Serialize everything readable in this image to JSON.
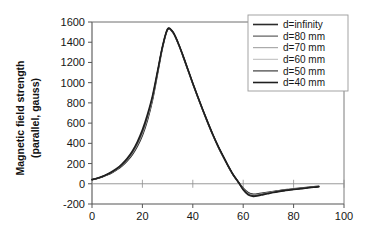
{
  "chart_data": {
    "type": "line",
    "title": "",
    "xlabel": "",
    "ylabel": "Magnetic field strength\n(parallel, gauss)",
    "ylabel_line1": "Magnetic field strength",
    "ylabel_line2": "(parallel, gauss)",
    "xlim": [
      0,
      100
    ],
    "ylim": [
      -200,
      1600
    ],
    "xticks": [
      0,
      20,
      40,
      60,
      80,
      100
    ],
    "xtick_labels": [
      "0",
      "20",
      "40",
      "60",
      "80",
      "100"
    ],
    "yticks": [
      -200,
      0,
      200,
      400,
      600,
      800,
      1000,
      1200,
      1400,
      1600
    ],
    "ytick_labels": [
      "-200",
      "0",
      "200",
      "400",
      "600",
      "800",
      "1000",
      "1200",
      "1400",
      "1600"
    ],
    "grid": false,
    "zero_line": true,
    "legend_position": "top-right",
    "legend_boxed": true,
    "legend": [
      "d=infinity",
      "d=80 mm",
      "d=70 mm",
      "d=60 mm",
      "d=50 mm",
      "d=40 mm"
    ],
    "x": [
      0,
      2,
      4,
      6,
      8,
      10,
      12,
      14,
      16,
      18,
      20,
      22,
      24,
      26,
      28,
      30,
      32,
      34,
      36,
      38,
      40,
      42,
      44,
      46,
      48,
      50,
      52,
      54,
      56,
      58,
      60,
      62,
      64,
      66,
      68,
      70,
      72,
      74,
      76,
      78,
      80,
      82,
      84,
      86,
      88,
      90
    ],
    "series": [
      {
        "name": "d=infinity",
        "color": "#2b2b2b",
        "width": 1.6,
        "values": [
          40,
          52,
          68,
          88,
          112,
          142,
          180,
          228,
          290,
          372,
          480,
          630,
          830,
          1090,
          1350,
          1525,
          1500,
          1400,
          1270,
          1130,
          990,
          855,
          725,
          600,
          480,
          370,
          270,
          175,
          88,
          18,
          -45,
          -88,
          -103,
          -100,
          -92,
          -84,
          -76,
          -69,
          -62,
          -56,
          -50,
          -45,
          -40,
          -35,
          -30,
          -25
        ]
      },
      {
        "name": "d=80 mm",
        "color": "#4d4d4d",
        "width": 1.1,
        "values": [
          40,
          52,
          68,
          88,
          112,
          143,
          182,
          231,
          294,
          378,
          488,
          638,
          836,
          1094,
          1352,
          1526,
          1501,
          1401,
          1271,
          1131,
          991,
          856,
          726,
          601,
          481,
          371,
          271,
          176,
          89,
          19,
          -47,
          -91,
          -106,
          -102,
          -94,
          -86,
          -78,
          -70,
          -63,
          -57,
          -51,
          -46,
          -41,
          -36,
          -31,
          -26
        ]
      },
      {
        "name": "d=70 mm",
        "color": "#8c8c8c",
        "width": 0.9,
        "values": [
          40,
          53,
          69,
          89,
          113,
          144,
          184,
          234,
          298,
          383,
          494,
          645,
          841,
          1097,
          1354,
          1527,
          1502,
          1402,
          1272,
          1132,
          992,
          857,
          727,
          602,
          482,
          372,
          272,
          177,
          90,
          19,
          -49,
          -94,
          -109,
          -105,
          -96,
          -88,
          -79,
          -71,
          -64,
          -58,
          -52,
          -47,
          -42,
          -37,
          -32,
          -27
        ]
      },
      {
        "name": "d=60 mm",
        "color": "#b3b3b3",
        "width": 0.9,
        "values": [
          41,
          53,
          70,
          90,
          115,
          146,
          187,
          238,
          303,
          390,
          502,
          654,
          848,
          1101,
          1356,
          1528,
          1503,
          1403,
          1273,
          1133,
          993,
          858,
          728,
          603,
          483,
          373,
          273,
          178,
          90,
          20,
          -52,
          -98,
          -113,
          -108,
          -99,
          -90,
          -81,
          -73,
          -66,
          -60,
          -54,
          -49,
          -43,
          -38,
          -33,
          -28
        ]
      },
      {
        "name": "d=50 mm",
        "color": "#3d3d3d",
        "width": 1.2,
        "values": [
          41,
          54,
          71,
          92,
          117,
          149,
          191,
          244,
          311,
          400,
          514,
          667,
          857,
          1106,
          1358,
          1529,
          1504,
          1404,
          1274,
          1134,
          994,
          859,
          729,
          604,
          484,
          374,
          274,
          179,
          91,
          20,
          -55,
          -103,
          -118,
          -112,
          -102,
          -93,
          -84,
          -75,
          -68,
          -61,
          -55,
          -50,
          -44,
          -39,
          -34,
          -29
        ]
      },
      {
        "name": "d=40 mm",
        "color": "#1f1f1f",
        "width": 1.6,
        "values": [
          42,
          55,
          73,
          95,
          121,
          154,
          198,
          253,
          323,
          416,
          534,
          686,
          870,
          1113,
          1361,
          1530,
          1505,
          1405,
          1275,
          1135,
          995,
          860,
          730,
          605,
          485,
          375,
          275,
          180,
          92,
          20,
          -60,
          -110,
          -125,
          -118,
          -107,
          -97,
          -87,
          -78,
          -70,
          -63,
          -57,
          -51,
          -45,
          -40,
          -35,
          -30
        ]
      }
    ]
  },
  "axes": {
    "y_title_line1": "Magnetic field strength",
    "y_title_line2": "(parallel, gauss)"
  },
  "colors": {
    "axis": "#555555",
    "frame": "#6e6e6e",
    "zero_line": "#8e8e8e",
    "text": "#161616",
    "background": "#ffffff"
  }
}
